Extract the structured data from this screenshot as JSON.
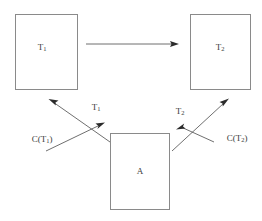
{
  "diagram": {
    "type": "block-diagram",
    "background_color": "#ffffff",
    "box_stroke_color": "#8a8a8a",
    "line_color": "#4a4a4a",
    "text_color": "#3a3a3a",
    "nodes": [
      {
        "id": "t1",
        "base": "T",
        "subscript": "1",
        "full_text": "T1"
      },
      {
        "id": "t2",
        "base": "T",
        "subscript": "2",
        "full_text": "T2"
      },
      {
        "id": "a",
        "base": "A",
        "subscript": "",
        "full_text": "A"
      }
    ],
    "edge_labels": [
      {
        "id": "left-up",
        "base": "T",
        "subscript": "1",
        "full_text": "T1"
      },
      {
        "id": "left-down",
        "base": "C(T",
        "subscript": "1",
        "suffix": ")",
        "full_text": "C(T1)"
      },
      {
        "id": "right-down",
        "base": "T",
        "subscript": "2",
        "full_text": "T2"
      },
      {
        "id": "right-up",
        "base": "C(T",
        "subscript": "2",
        "suffix": ")",
        "full_text": "C(T2)"
      }
    ]
  }
}
